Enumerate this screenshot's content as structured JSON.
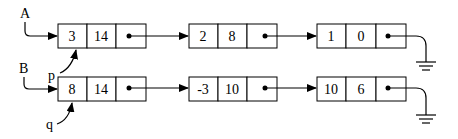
{
  "lists": [
    {
      "head_label": "A",
      "nodes": [
        {
          "data": "3",
          "next_val": "14"
        },
        {
          "data": "2",
          "next_val": "8"
        },
        {
          "data": "1",
          "next_val": "0"
        }
      ]
    },
    {
      "head_label": "B",
      "nodes": [
        {
          "data": "8",
          "next_val": "14"
        },
        {
          "data": "-3",
          "next_val": "10"
        },
        {
          "data": "10",
          "next_val": "6"
        }
      ]
    }
  ],
  "pointers": {
    "p": "p",
    "q": "q"
  }
}
